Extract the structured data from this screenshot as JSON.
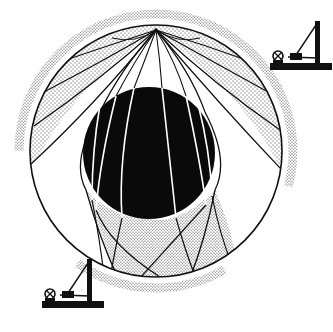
{
  "diagram": {
    "title": "Seismic wave paths through Earth and core shadow zone",
    "colors": {
      "background": "#ffffff",
      "ink": "#111111",
      "stipple": "#2a2a2a",
      "core": "#0a0a0a",
      "ray_in_core": "#ffffff"
    },
    "earth": {
      "cx": 156,
      "cy": 151,
      "r": 126
    },
    "core": {
      "cx": 149,
      "cy": 153,
      "r": 66
    },
    "source": {
      "x": 156,
      "y": 30
    },
    "outer_arrival_bands": [
      {
        "id": "left-upper",
        "r": 137,
        "start_deg": 180,
        "end_deg": 292
      },
      {
        "id": "right-upper",
        "r": 137,
        "start_deg": 292,
        "end_deg": 375
      },
      {
        "id": "bottom",
        "r": 137,
        "start_deg": 60,
        "end_deg": 125
      }
    ],
    "seismographs": [
      {
        "id": "seismograph-top-right",
        "x": 258,
        "y": 8,
        "scale": 1
      },
      {
        "id": "seismograph-bottom-left",
        "x": 30,
        "y": 246,
        "scale": 1
      }
    ],
    "regions": [
      {
        "id": "direct-wave-zone",
        "fill": "stipple"
      },
      {
        "id": "shadow-zone-left",
        "fill": "white"
      },
      {
        "id": "shadow-zone-right",
        "fill": "white"
      },
      {
        "id": "core-transmitted-zone",
        "fill": "stipple"
      }
    ]
  }
}
